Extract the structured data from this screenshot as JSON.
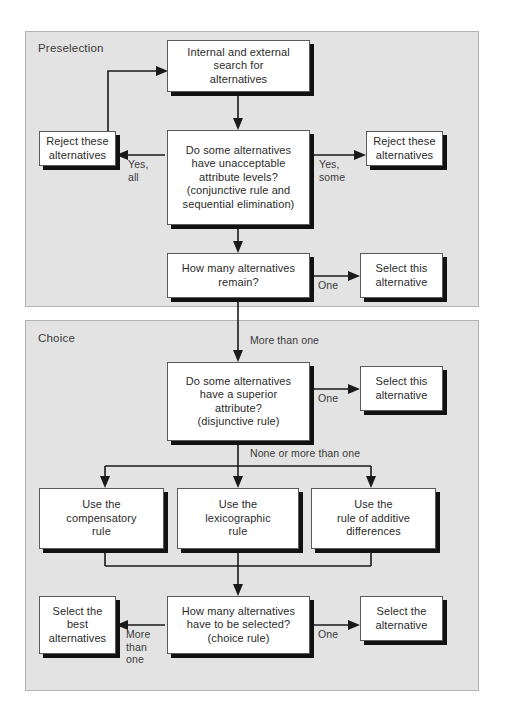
{
  "diagram": {
    "panels": [
      {
        "id": "preselection",
        "label": "Preselection"
      },
      {
        "id": "choice",
        "label": "Choice"
      }
    ],
    "colors": {
      "panel_fill": "#e3e3e3",
      "panel_border": "#b4b4b4",
      "box_fill": "#ffffff",
      "box_border": "#5a5a5a",
      "shadow": "#111111",
      "connector": "#1a1a1a",
      "text": "#2b2b2b"
    },
    "nodes": {
      "search": "Internal and external\nsearch for\nalternatives",
      "unacceptable": "Do some alternatives\nhave unacceptable\nattribute levels?\n(conjunctive rule and\nsequential elimination)",
      "reject_left": "Reject these\nalternatives",
      "reject_right": "Reject these\nalternatives",
      "how_many_remain": "How many alternatives\nremain?",
      "select_this_1": "Select this\nalternative",
      "superior": "Do some alternatives\nhave a superior\nattribute?\n(disjunctive rule)",
      "select_this_2": "Select this\nalternative",
      "compensatory": "Use the\ncompensatory\nrule",
      "lexicographic": "Use the\nlexicographic\nrule",
      "additive": "Use the\nrule of additive\ndifferences",
      "select_best": "Select the\nbest\nalternatives",
      "how_many_selected": "How many alternatives\nhave to be selected?\n(choice rule)",
      "select_alternative": "Select the\nalternative"
    },
    "edge_labels": {
      "yes_all": "Yes,\nall",
      "yes_some": "Yes,\nsome",
      "one_1": "One",
      "more_than_one_top": "More than one",
      "one_2": "One",
      "none_or_more": "None or more than one",
      "more_than_one_bottom": "More\nthan\none",
      "one_3": "One"
    }
  }
}
